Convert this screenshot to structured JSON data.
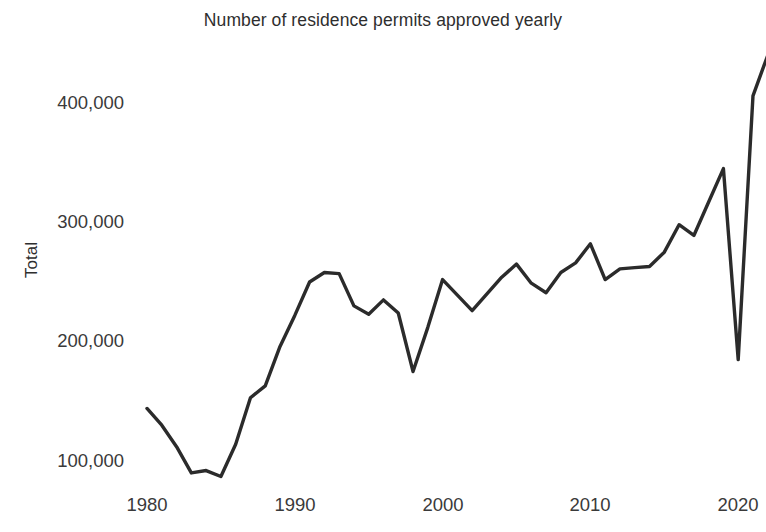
{
  "chart_data": {
    "type": "line",
    "title": "Number of residence permits approved yearly",
    "xlabel": "",
    "ylabel": "Total",
    "grid": false,
    "legend": "none",
    "xlim": [
      1979.2,
      2021.9
    ],
    "ylim": [
      75000,
      445000
    ],
    "xticks": [
      1980,
      1990,
      2000,
      2010,
      2020
    ],
    "xtick_labels": [
      "1980",
      "1990",
      "2000",
      "2010",
      "2020"
    ],
    "yticks": [
      100000,
      200000,
      300000,
      400000
    ],
    "ytick_labels": [
      "100,000",
      "200,000",
      "300,000",
      "400,000"
    ],
    "line_color": "#2b2b2b",
    "line_width": 3.4,
    "x": [
      1980,
      1981,
      1982,
      1983,
      1984,
      1985,
      1986,
      1987,
      1988,
      1989,
      1990,
      1991,
      1992,
      1993,
      1994,
      1995,
      1996,
      1997,
      1998,
      1999,
      2000,
      2001,
      2002,
      2003,
      2004,
      2005,
      2006,
      2007,
      2008,
      2009,
      2010,
      2011,
      2012,
      2013,
      2014,
      2015,
      2016,
      2017,
      2018,
      2019,
      2020,
      2021,
      2022
    ],
    "values": [
      144000,
      130000,
      112000,
      90000,
      92000,
      87000,
      114000,
      153000,
      163000,
      196000,
      222000,
      250000,
      258000,
      257000,
      230000,
      223000,
      235000,
      224000,
      175000,
      212000,
      252000,
      239000,
      226000,
      240000,
      254000,
      265000,
      249000,
      241000,
      258000,
      266000,
      282000,
      252000,
      261000,
      262000,
      263000,
      275000,
      298000,
      289000,
      317000,
      345000,
      185000,
      406000,
      440000
    ],
    "annotations": []
  },
  "axis": {
    "ytick_1": "100,000",
    "ytick_2": "200,000",
    "ytick_3": "300,000",
    "ytick_4": "400,000",
    "xtick_1": "1980",
    "xtick_2": "1990",
    "xtick_3": "2000",
    "xtick_4": "2010",
    "xtick_5": "2020"
  }
}
